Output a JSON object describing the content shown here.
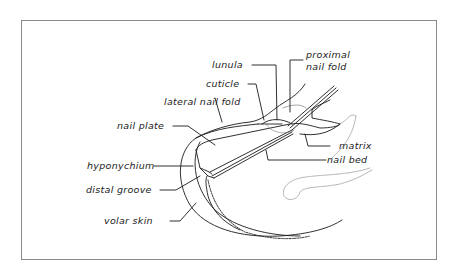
{
  "diagram": {
    "labels": {
      "lunula": "lunula",
      "proximal_nail_fold_1": "proximal",
      "proximal_nail_fold_2": "nail fold",
      "cuticle": "cuticle",
      "lateral_nail_fold": "lateral nail fold",
      "nail_plate": "nail plate",
      "matrix": "matrix",
      "nail_bed": "nail bed",
      "hyponychium": "hyponychium",
      "distal_groove": "distal groove",
      "volar_skin": "volar skin"
    },
    "colors": {
      "line": "#1a1a1a",
      "frame": "#8a8a8a",
      "text": "#222222"
    }
  }
}
